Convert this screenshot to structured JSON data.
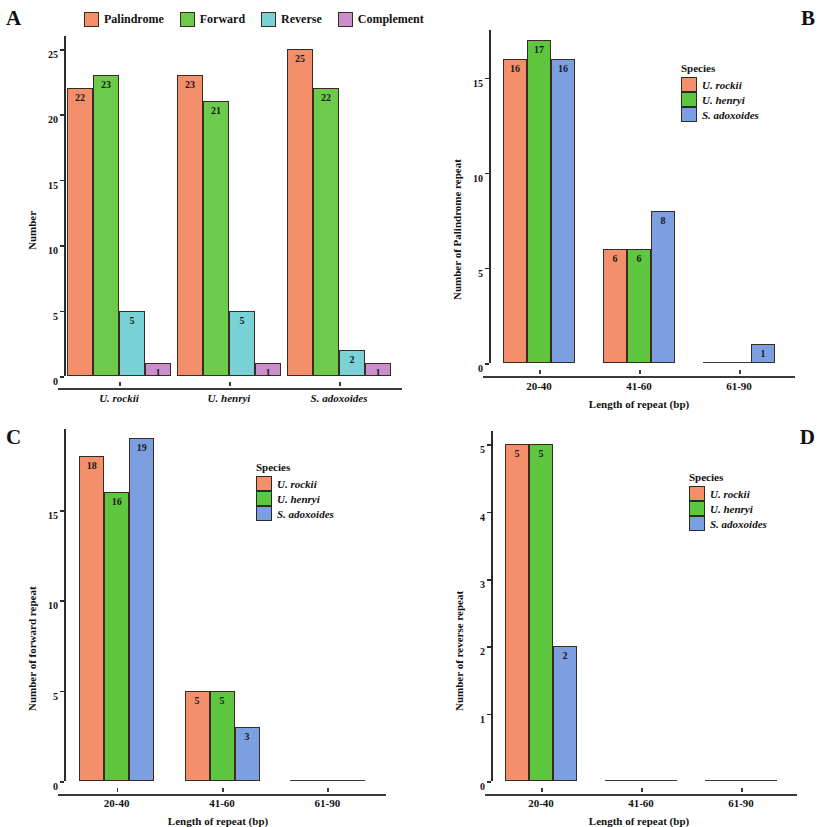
{
  "figure": {
    "panels": [
      {
        "letter": "A"
      },
      {
        "letter": "B"
      },
      {
        "letter": "C"
      },
      {
        "letter": "D"
      }
    ]
  },
  "colors": {
    "palindrome": "#F3906B",
    "forward": "#6DCB4C",
    "reverse": "#79D2D6",
    "complement": "#C98FCB",
    "u_rockii": "#F3906B",
    "u_henryi": "#5FC63F",
    "s_adoxoides": "#7B9FE0",
    "axis": "#2b2b2b"
  },
  "legend_a": {
    "items": [
      {
        "label": "Palindrome",
        "color_key": "palindrome"
      },
      {
        "label": "Forward",
        "color_key": "forward"
      },
      {
        "label": "Reverse",
        "color_key": "reverse"
      },
      {
        "label": "Complement",
        "color_key": "complement"
      }
    ]
  },
  "legend_species": {
    "title": "Species",
    "items": [
      {
        "label": "U. rockii",
        "color_key": "u_rockii"
      },
      {
        "label": "U. henryi",
        "color_key": "u_henryi"
      },
      {
        "label": "S. adoxoides",
        "color_key": "s_adoxoides"
      }
    ]
  },
  "chart_data": [
    {
      "panel": "A",
      "type": "bar",
      "title": "",
      "xlabel": "",
      "ylabel": "Number",
      "categories": [
        "U. rockii",
        "U. henryi",
        "S. adoxoides"
      ],
      "ylim": [
        0,
        26
      ],
      "yticks": [
        0,
        5,
        10,
        15,
        20,
        25
      ],
      "grid": false,
      "legend_position": "top",
      "series": [
        {
          "name": "Palindrome",
          "color_key": "palindrome",
          "values": [
            22,
            23,
            25
          ]
        },
        {
          "name": "Forward",
          "color_key": "forward",
          "values": [
            23,
            21,
            22
          ]
        },
        {
          "name": "Reverse",
          "color_key": "reverse",
          "values": [
            5,
            5,
            2
          ]
        },
        {
          "name": "Complement",
          "color_key": "complement",
          "values": [
            1,
            1,
            1
          ]
        }
      ]
    },
    {
      "panel": "B",
      "type": "bar",
      "title": "",
      "xlabel": "Length of repeat (bp)",
      "ylabel": "Number of Palindrome repeat",
      "categories": [
        "20-40",
        "41-60",
        "61-90"
      ],
      "ylim": [
        0,
        17.5
      ],
      "yticks": [
        0,
        5,
        10,
        15
      ],
      "grid": false,
      "legend_position": "right",
      "series": [
        {
          "name": "U. rockii",
          "color_key": "u_rockii",
          "values": [
            16,
            6,
            0
          ]
        },
        {
          "name": "U. henryi",
          "color_key": "u_henryi",
          "values": [
            17,
            6,
            0
          ]
        },
        {
          "name": "S. adoxoides",
          "color_key": "s_adoxoides",
          "values": [
            16,
            8,
            1
          ]
        }
      ]
    },
    {
      "panel": "C",
      "type": "bar",
      "title": "",
      "xlabel": "Length of repeat (bp)",
      "ylabel": "Number of forward repeat",
      "categories": [
        "20-40",
        "41-60",
        "61-90"
      ],
      "ylim": [
        0,
        19.5
      ],
      "yticks": [
        0,
        5,
        10,
        15
      ],
      "grid": false,
      "legend_position": "right",
      "series": [
        {
          "name": "U. rockii",
          "color_key": "u_rockii",
          "values": [
            18,
            5,
            0
          ]
        },
        {
          "name": "U. henryi",
          "color_key": "u_henryi",
          "values": [
            16,
            5,
            0
          ]
        },
        {
          "name": "S. adoxoides",
          "color_key": "s_adoxoides",
          "values": [
            19,
            3,
            0
          ]
        }
      ]
    },
    {
      "panel": "D",
      "type": "bar",
      "title": "",
      "xlabel": "Length of repeat (bp)",
      "ylabel": "Number of reverse repeat",
      "categories": [
        "20-40",
        "41-60",
        "61-90"
      ],
      "ylim": [
        0,
        5.2
      ],
      "yticks": [
        0,
        1,
        2,
        3,
        4,
        5
      ],
      "grid": false,
      "legend_position": "right",
      "series": [
        {
          "name": "U. rockii",
          "color_key": "u_rockii",
          "values": [
            5,
            0,
            0
          ]
        },
        {
          "name": "U. henryi",
          "color_key": "u_henryi",
          "values": [
            5,
            0,
            0
          ]
        },
        {
          "name": "S. adoxoides",
          "color_key": "s_adoxoides",
          "values": [
            2,
            0,
            0
          ]
        }
      ]
    }
  ]
}
